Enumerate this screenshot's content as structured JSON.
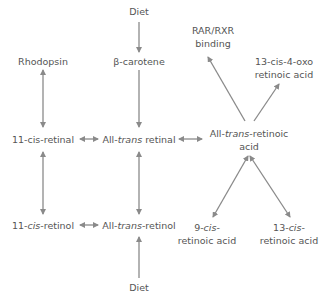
{
  "colors": {
    "text": "#555555",
    "arrow": "#8a8a8a",
    "background": "#ffffff"
  },
  "nodes": {
    "diet_top": {
      "text": "Diet"
    },
    "beta_carotene": {
      "text": "β-carotene"
    },
    "rhodopsin": {
      "text": "Rhodopsin"
    },
    "rar_rxr": {
      "line1": "RAR/RXR",
      "line2": "binding"
    },
    "oxo_acid": {
      "line1": "13-cis-4-oxo",
      "line2": "retinoic acid"
    },
    "cis_retinal": {
      "text": "11-cis-retinal"
    },
    "trans_retinal": {
      "prefix": "All-",
      "italic": "trans",
      "suffix": " retinal"
    },
    "trans_retinoic": {
      "prefix": "All-",
      "italic": "trans",
      "suffix": "-retinoic",
      "line2": "acid"
    },
    "cis_retinol": {
      "prefix": "11-",
      "italic": "cis",
      "suffix": "-retinol"
    },
    "trans_retinol": {
      "prefix": "All-",
      "italic": "trans",
      "suffix": "-retinol"
    },
    "cis9_acid": {
      "line1_prefix": "9-",
      "line1_italic": "cis",
      "line1_suffix": "-",
      "line2": "retinoic acid"
    },
    "cis13_acid": {
      "line1_prefix": "13-",
      "line1_italic": "cis",
      "line1_suffix": "-",
      "line2": "retinoic acid"
    },
    "diet_bottom": {
      "text": "Diet"
    }
  },
  "edges": [
    {
      "from": "diet_top",
      "to": "beta_carotene",
      "type": "one-way"
    },
    {
      "from": "beta_carotene",
      "to": "trans_retinal",
      "type": "one-way"
    },
    {
      "from": "rhodopsin",
      "to": "cis_retinal",
      "type": "two-way"
    },
    {
      "from": "cis_retinal",
      "to": "trans_retinal",
      "type": "two-way"
    },
    {
      "from": "trans_retinal",
      "to": "trans_retinoic",
      "type": "two-way"
    },
    {
      "from": "trans_retinoic",
      "to": "rar_rxr",
      "type": "one-way"
    },
    {
      "from": "trans_retinoic",
      "to": "oxo_acid",
      "type": "one-way"
    },
    {
      "from": "cis_retinal",
      "to": "cis_retinol",
      "type": "two-way"
    },
    {
      "from": "trans_retinal",
      "to": "trans_retinol",
      "type": "two-way"
    },
    {
      "from": "cis_retinol",
      "to": "trans_retinol",
      "type": "two-way"
    },
    {
      "from": "trans_retinoic",
      "to": "cis9_acid",
      "type": "two-way"
    },
    {
      "from": "trans_retinoic",
      "to": "cis13_acid",
      "type": "two-way"
    },
    {
      "from": "diet_bottom",
      "to": "trans_retinol",
      "type": "one-way"
    }
  ]
}
